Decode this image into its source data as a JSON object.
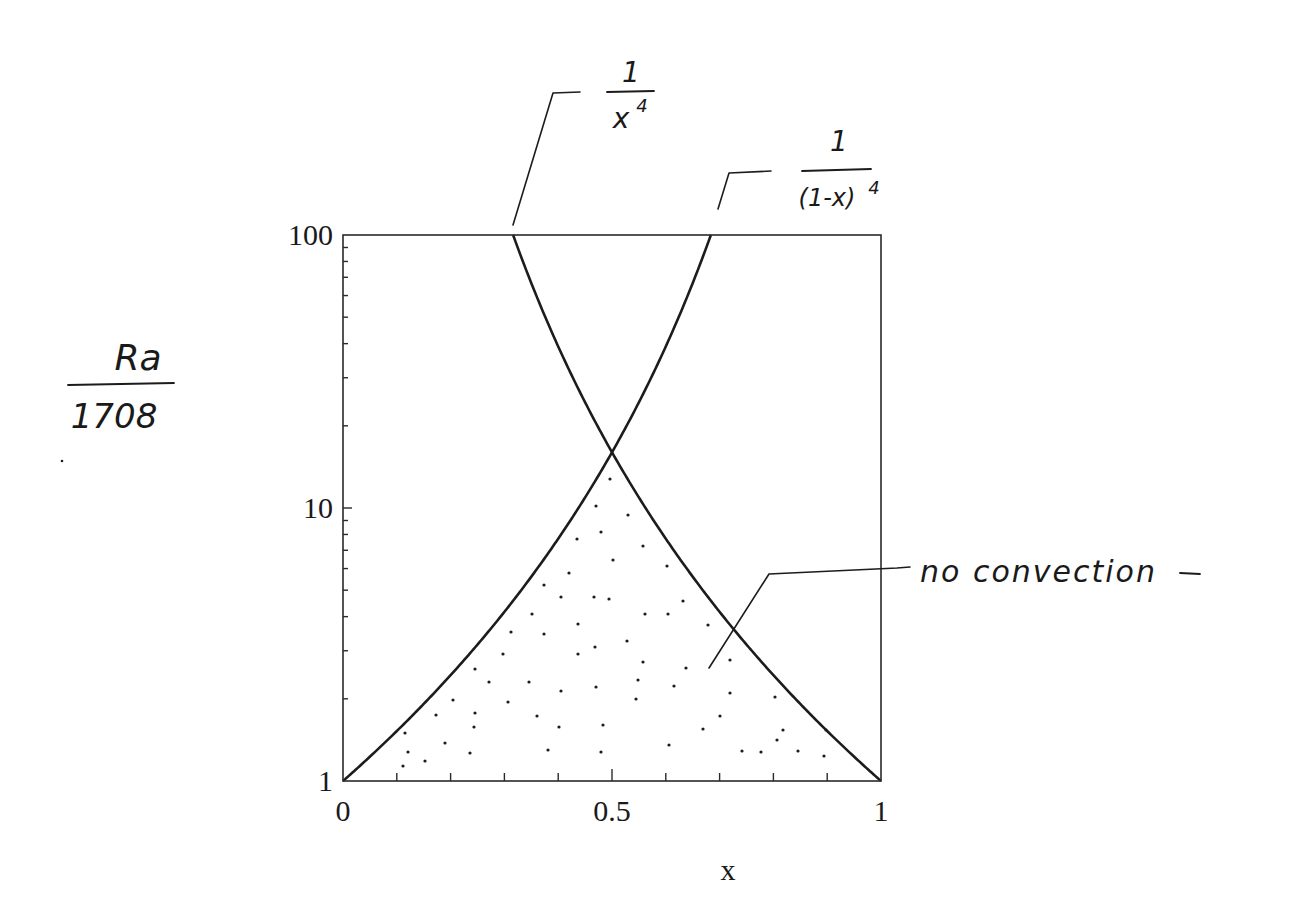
{
  "chart_data": {
    "type": "line",
    "title": "",
    "xlabel": "x",
    "ylabel": "Ra / 1708",
    "ylabel_numerator": "Ra",
    "ylabel_denominator": "1708",
    "xscale": "linear",
    "yscale": "log",
    "xlim": [
      0,
      1
    ],
    "ylim": [
      1,
      100
    ],
    "grid": false,
    "legend": null,
    "x_ticks": [
      {
        "value": 0,
        "label": "0"
      },
      {
        "value": 0.5,
        "label": "0.5"
      },
      {
        "value": 1,
        "label": "1"
      }
    ],
    "x_minor_ticks": [
      0.1,
      0.2,
      0.3,
      0.4,
      0.6,
      0.7,
      0.8,
      0.9
    ],
    "y_ticks": [
      {
        "value": 1,
        "label": "1"
      },
      {
        "value": 10,
        "label": "10"
      },
      {
        "value": 100,
        "label": "100"
      }
    ],
    "y_minor_ticks": [
      2,
      3,
      4,
      5,
      6,
      7,
      8,
      9,
      20,
      30,
      40,
      50,
      60,
      70,
      80,
      90
    ],
    "series": [
      {
        "name": "1/x^4",
        "formula": "1/x^4",
        "x": [
          0.316,
          0.35,
          0.4,
          0.45,
          0.5,
          0.55,
          0.6,
          0.65,
          0.7,
          0.75,
          0.8,
          0.85,
          0.9,
          0.95,
          1.0
        ],
        "values": [
          100,
          66.6,
          39.1,
          24.4,
          16,
          10.9,
          7.72,
          5.6,
          4.16,
          3.16,
          2.44,
          1.92,
          1.52,
          1.23,
          1.0
        ]
      },
      {
        "name": "1/(1-x)^4",
        "formula": "1/(1-x)^4",
        "x": [
          0.0,
          0.05,
          0.1,
          0.15,
          0.2,
          0.25,
          0.3,
          0.35,
          0.4,
          0.45,
          0.5,
          0.55,
          0.6,
          0.65,
          0.684
        ],
        "values": [
          1.0,
          1.23,
          1.52,
          1.92,
          2.44,
          3.16,
          4.16,
          5.6,
          7.72,
          10.9,
          16,
          24.4,
          39.1,
          66.6,
          100
        ]
      }
    ],
    "intersection": {
      "x": 0.5,
      "y": 16
    },
    "shaded_region": {
      "label": "no convection",
      "description": "Stippled region below both curves (below the lower envelope of 1/x^4 and 1/(1-x)^4)",
      "pattern": "dots"
    },
    "annotations": [
      {
        "text": "1/x^4",
        "numerator": "1",
        "denominator": "x",
        "exponent": "4",
        "points_to": "1/x^4 curve at top edge (x≈0.316)"
      },
      {
        "text": "1/(1-x)^4",
        "numerator": "1",
        "denominator": "(1-x)",
        "exponent": "4",
        "points_to": "1/(1-x)^4 curve at top edge (x≈0.684)"
      },
      {
        "text": "no convection",
        "points_to": "stippled region"
      }
    ]
  },
  "labels": {
    "x_axis": "x",
    "y_num": "Ra",
    "y_den": "1708",
    "ann1_num": "1",
    "ann1_den": "x",
    "ann1_exp": "4",
    "ann2_num": "1",
    "ann2_den": "(1-x)",
    "ann2_exp": "4",
    "ann3": "no convection"
  },
  "layout": {
    "plot": {
      "left": 343,
      "top": 235,
      "right": 881,
      "bottom": 781
    },
    "stipple_dots": [
      [
        610,
        479
      ],
      [
        596,
        506
      ],
      [
        628,
        515
      ],
      [
        601,
        532
      ],
      [
        577,
        539
      ],
      [
        613,
        560
      ],
      [
        643,
        546
      ],
      [
        667,
        566
      ],
      [
        569,
        573
      ],
      [
        594,
        597
      ],
      [
        544,
        585
      ],
      [
        561,
        597
      ],
      [
        609,
        599
      ],
      [
        645,
        614
      ],
      [
        668,
        614
      ],
      [
        683,
        601
      ],
      [
        532,
        614
      ],
      [
        578,
        624
      ],
      [
        511,
        632
      ],
      [
        544,
        634
      ],
      [
        595,
        647
      ],
      [
        578,
        654
      ],
      [
        627,
        641
      ],
      [
        708,
        625
      ],
      [
        643,
        662
      ],
      [
        686,
        668
      ],
      [
        503,
        654
      ],
      [
        475,
        669
      ],
      [
        529,
        682
      ],
      [
        489,
        682
      ],
      [
        561,
        691
      ],
      [
        596,
        687
      ],
      [
        638,
        680
      ],
      [
        674,
        686
      ],
      [
        730,
        660
      ],
      [
        453,
        700
      ],
      [
        508,
        702
      ],
      [
        730,
        693
      ],
      [
        775,
        697
      ],
      [
        475,
        713
      ],
      [
        436,
        715
      ],
      [
        474,
        727
      ],
      [
        537,
        716
      ],
      [
        636,
        699
      ],
      [
        559,
        727
      ],
      [
        603,
        725
      ],
      [
        720,
        716
      ],
      [
        703,
        729
      ],
      [
        777,
        740
      ],
      [
        783,
        730
      ],
      [
        826,
        730
      ],
      [
        405,
        733
      ],
      [
        445,
        743
      ],
      [
        548,
        750
      ],
      [
        601,
        752
      ],
      [
        742,
        751
      ],
      [
        669,
        745
      ],
      [
        761,
        752
      ],
      [
        798,
        751
      ],
      [
        425,
        761
      ],
      [
        408,
        752
      ],
      [
        824,
        756
      ],
      [
        470,
        753
      ],
      [
        403,
        766
      ]
    ]
  }
}
